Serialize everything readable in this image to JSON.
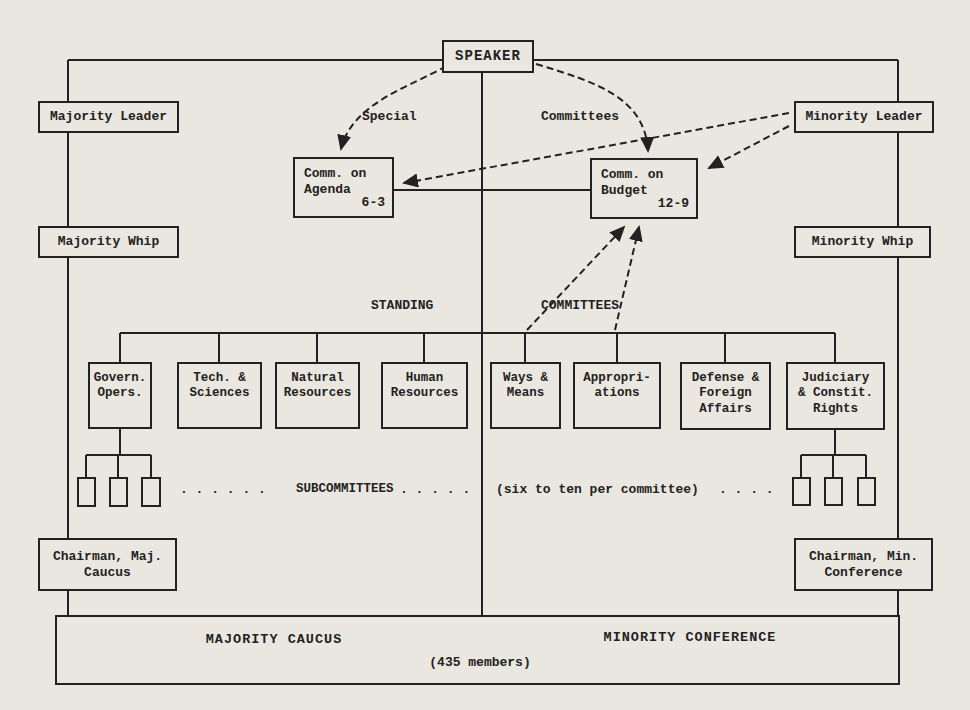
{
  "page": {
    "paper": "#eae7e0",
    "ink": "#222222"
  },
  "nodes": {
    "speaker": "SPEAKER",
    "majority_leader": "Majority Leader",
    "minority_leader": "Minority Leader",
    "majority_whip": "Majority Whip",
    "minority_whip": "Minority Whip",
    "comm_agenda": {
      "title": "Comm. on\nAgenda",
      "ratio": "6-3"
    },
    "comm_budget": {
      "title": "Comm. on\nBudget",
      "ratio": "12-9"
    },
    "chairman_maj": "Chairman, Maj.\nCaucus",
    "chairman_min": "Chairman, Min.\nConference"
  },
  "labels": {
    "special": "Special",
    "committees_top": "Committees",
    "standing": "STANDING",
    "standing_committees": "COMMITTEES",
    "subcommittees": "SUBCOMMITTEES",
    "subcommittees_note": "(six to ten per committee)",
    "dots_left": ". . . . . .",
    "dots_mid": ". . . . .",
    "dots_right": ". . . ."
  },
  "standing_committees": [
    {
      "label": "Govern.\nOpers."
    },
    {
      "label": "Tech. &\nSciences"
    },
    {
      "label": "Natural\nResources"
    },
    {
      "label": "Human\nResources"
    },
    {
      "label": "Ways &\nMeans"
    },
    {
      "label": "Appropri-\nations"
    },
    {
      "label": "Defense &\nForeign\nAffairs"
    },
    {
      "label": "Judiciary\n& Constit.\nRights"
    }
  ],
  "bottom": {
    "majority_caucus": "MAJORITY CAUCUS",
    "minority_conference": "MINORITY CONFERENCE",
    "members": "(435 members)"
  }
}
